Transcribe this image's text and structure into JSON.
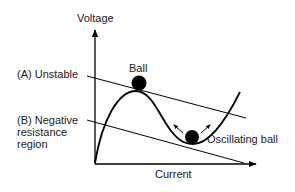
{
  "axes": {
    "y_label": "Voltage",
    "x_label": "Current"
  },
  "labels": {
    "a_unstable": "(A)  Unstable",
    "b_line1": "(B)  Negative",
    "b_line2": "resistance",
    "b_line3": "region",
    "ball": "Ball",
    "oscillating_ball": "Oscillating ball"
  },
  "colors": {
    "stroke": "#000000",
    "text": "#222222",
    "background": "#ffffff"
  }
}
